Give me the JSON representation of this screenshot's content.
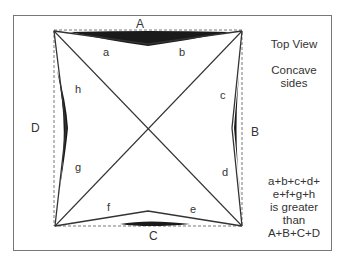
{
  "diagram": {
    "side_labels": {
      "top": "A",
      "right": "B",
      "bottom": "C",
      "left": "D"
    },
    "segment_labels": [
      "a",
      "b",
      "c",
      "d",
      "e",
      "f",
      "g",
      "h"
    ],
    "colors": {
      "line": "#333333",
      "shading": "#1a1a1a",
      "frame": "#777777"
    }
  },
  "notes": {
    "title": "Top View",
    "subtitle_line1": "Concave",
    "subtitle_line2": "sides",
    "statement_line1": "a+b+c+d+",
    "statement_line2": "e+f+g+h",
    "statement_line3": "is greater",
    "statement_line4": "than",
    "statement_line5": "A+B+C+D"
  }
}
